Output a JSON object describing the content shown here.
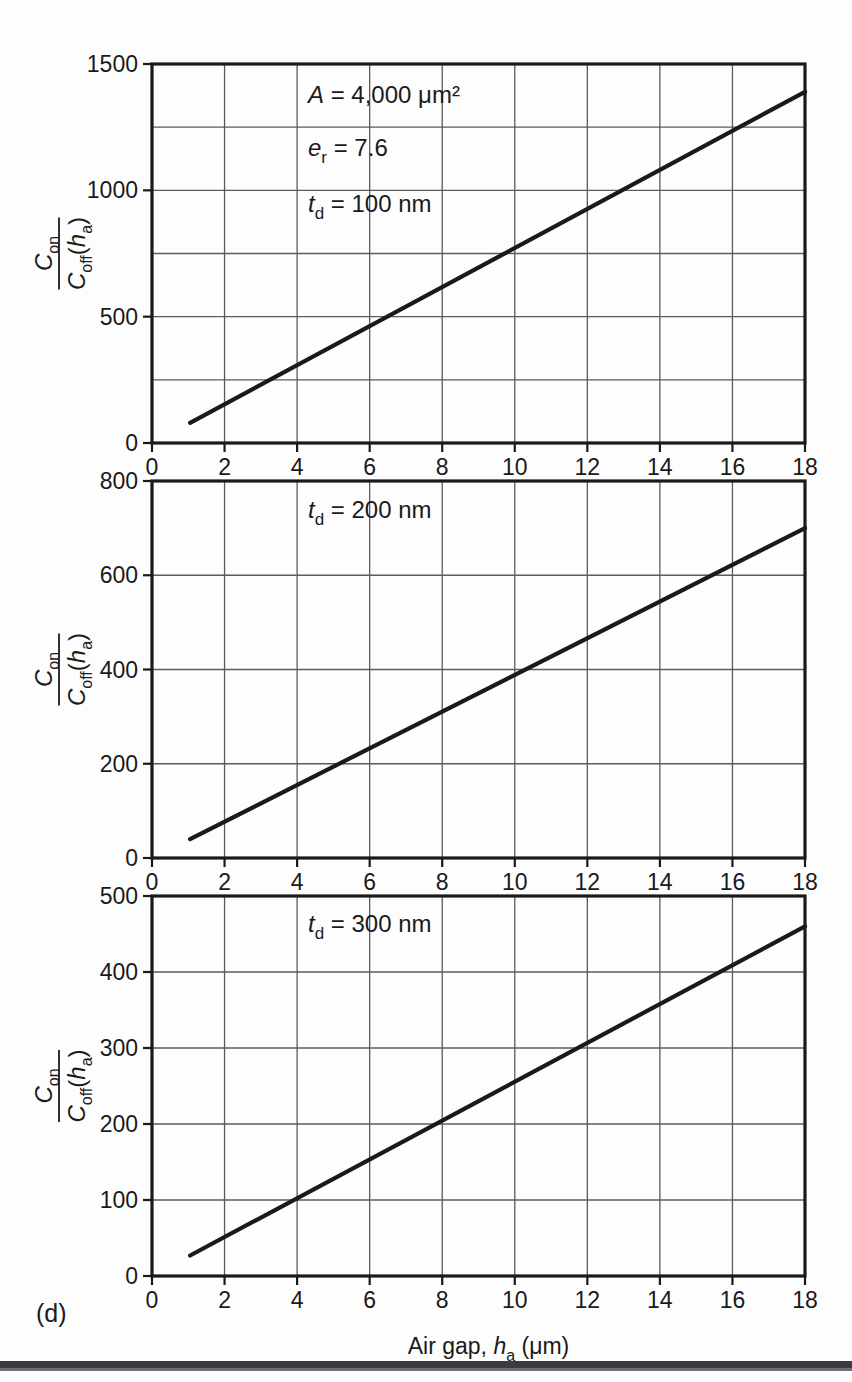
{
  "figure": {
    "panel_tag": "(d)",
    "xlabel_parts": {
      "pre": "Air gap, ",
      "var": "h",
      "sub": "a",
      "post": " (μm)"
    },
    "ylabel_parts": {
      "num_main": "C",
      "num_sub": "on",
      "den_main": "C",
      "den_sub": "off",
      "den_arg_open": "(",
      "den_arg_var": "h",
      "den_arg_sub": "a",
      "den_arg_close": ")"
    }
  },
  "chart_data": [
    {
      "type": "line",
      "panel": 1,
      "title": "",
      "xlabel": "Air gap, h_a (μm)",
      "ylabel": "C_on / C_off(h_a)",
      "xlim": [
        0,
        18
      ],
      "ylim": [
        0,
        1500
      ],
      "xticks": [
        0,
        2,
        4,
        6,
        8,
        10,
        12,
        14,
        16,
        18
      ],
      "xticklabels": [
        "0",
        "2",
        "4",
        "6",
        "8",
        "10",
        "12",
        "14",
        "16",
        "18"
      ],
      "yticks": [
        0,
        500,
        1000,
        1500
      ],
      "yticklabels": [
        "0",
        "500",
        "1000",
        "1500"
      ],
      "y_gridlines": [
        250,
        500,
        750,
        1000,
        1250
      ],
      "grid": true,
      "legend": "none",
      "annotations": [
        {
          "text": "A = 4,000 μm²",
          "var": "A",
          "value": "4,000 μm²",
          "x": 4.3,
          "y": 1345
        },
        {
          "text": "e_r = 7.6",
          "var": "e",
          "sub": "r",
          "value": "7.6",
          "x": 4.3,
          "y": 1135
        },
        {
          "text": "t_d = 100 nm",
          "var": "t",
          "sub": "d",
          "value": "100 nm",
          "x": 4.3,
          "y": 915
        }
      ],
      "series": [
        {
          "name": "t_d = 100 nm",
          "x": [
            1.05,
            18
          ],
          "values": [
            80,
            1390
          ]
        }
      ]
    },
    {
      "type": "line",
      "panel": 2,
      "title": "",
      "xlabel": "Air gap, h_a (μm)",
      "ylabel": "C_on / C_off(h_a)",
      "xlim": [
        0,
        18
      ],
      "ylim": [
        0,
        800
      ],
      "xticks": [
        0,
        2,
        4,
        6,
        8,
        10,
        12,
        14,
        16,
        18
      ],
      "xticklabels": [
        "0",
        "2",
        "4",
        "6",
        "8",
        "10",
        "12",
        "14",
        "16",
        "18"
      ],
      "yticks": [
        0,
        200,
        400,
        600,
        800
      ],
      "yticklabels": [
        "0",
        "200",
        "400",
        "600",
        "800"
      ],
      "y_gridlines": [
        200,
        400,
        600
      ],
      "grid": true,
      "legend": "none",
      "annotations": [
        {
          "text": "t_d = 200 nm",
          "var": "t",
          "sub": "d",
          "value": "200 nm",
          "x": 4.3,
          "y": 722
        }
      ],
      "series": [
        {
          "name": "t_d = 200 nm",
          "x": [
            1.05,
            18
          ],
          "values": [
            40,
            700
          ]
        }
      ]
    },
    {
      "type": "line",
      "panel": 3,
      "title": "",
      "xlabel": "Air gap, h_a (μm)",
      "ylabel": "C_on / C_off(h_a)",
      "xlim": [
        0,
        18
      ],
      "ylim": [
        0,
        500
      ],
      "xticks": [
        0,
        2,
        4,
        6,
        8,
        10,
        12,
        14,
        16,
        18
      ],
      "xticklabels": [
        "0",
        "2",
        "4",
        "6",
        "8",
        "10",
        "12",
        "14",
        "16",
        "18"
      ],
      "yticks": [
        0,
        100,
        200,
        300,
        400,
        500
      ],
      "yticklabels": [
        "0",
        "100",
        "200",
        "300",
        "400",
        "500"
      ],
      "y_gridlines": [
        100,
        200,
        300,
        400
      ],
      "grid": true,
      "legend": "none",
      "annotations": [
        {
          "text": "t_d = 300 nm",
          "var": "t",
          "sub": "d",
          "value": "300 nm",
          "x": 4.3,
          "y": 452
        }
      ],
      "series": [
        {
          "name": "t_d = 300 nm",
          "x": [
            1.05,
            18
          ],
          "values": [
            27,
            460
          ]
        }
      ]
    }
  ]
}
